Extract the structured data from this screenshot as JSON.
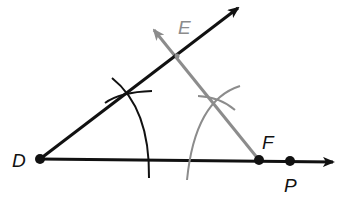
{
  "diagram": {
    "type": "geometric-construction",
    "colors": {
      "primary": "#111111",
      "construction": "#8c8c8c",
      "background": "#ffffff"
    },
    "points": {
      "D": {
        "label": "D",
        "x": 40,
        "y": 159
      },
      "E": {
        "label": "E",
        "x": 177,
        "y": 56
      },
      "F": {
        "label": "F",
        "x": 259,
        "y": 160
      },
      "P": {
        "label": "P",
        "x": 290,
        "y": 161
      }
    },
    "rays": [
      {
        "name": "ray-DE",
        "from": "D",
        "through": "E",
        "color": "primary"
      },
      {
        "name": "ray-DP",
        "from": "D",
        "through": "P",
        "color": "primary"
      },
      {
        "name": "ray-FE",
        "from": "F",
        "through": "E",
        "color": "construction"
      }
    ]
  }
}
